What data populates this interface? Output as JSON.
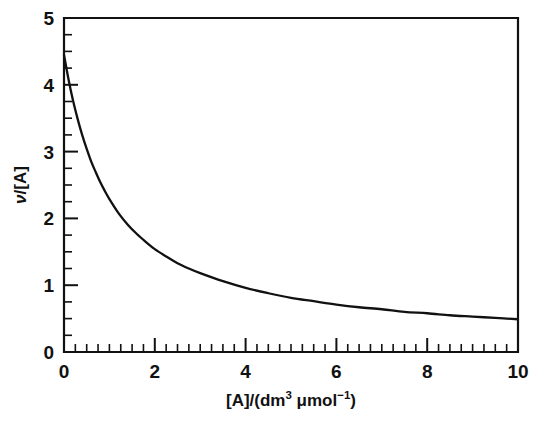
{
  "figure": {
    "background_color": "#ffffff",
    "line_color": "#111111",
    "width": 544,
    "height": 428
  },
  "axes": {
    "x": {
      "title_parts": {
        "lead": "[A]/(dm",
        "exp1": "3",
        "mid": " μmol",
        "exp2": "−1",
        "tail": ")"
      },
      "title_plain": "[A]/(dm3 μmol−1)",
      "tick_labels": [
        "0",
        "2",
        "4",
        "6",
        "8",
        "10"
      ],
      "tick_values": [
        0,
        2,
        4,
        6,
        8,
        10
      ],
      "minor_step": 0.25,
      "range": [
        0,
        10
      ]
    },
    "y": {
      "title_parts": {
        "symbol": "ν",
        "rest": "/[A]"
      },
      "title_plain": "ν/[A]",
      "tick_labels": [
        "0",
        "1",
        "2",
        "3",
        "4",
        "5"
      ],
      "tick_values": [
        0,
        1,
        2,
        3,
        4,
        5
      ],
      "minor_step": 0.25,
      "range": [
        0,
        5
      ]
    }
  },
  "chart_data": {
    "type": "line",
    "title": "",
    "subtitle": "",
    "xlabel": "[A]/(dm3 μmol−1)",
    "ylabel": "ν/[A]",
    "xlim": [
      0,
      10
    ],
    "ylim": [
      0,
      5
    ],
    "grid": false,
    "legend": null,
    "annotations": [],
    "series": [
      {
        "name": "v/[A] vs [A]",
        "color": "#111111",
        "x": [
          0.0,
          0.1,
          0.2,
          0.3,
          0.4,
          0.5,
          0.6,
          0.7,
          0.8,
          0.9,
          1.0,
          1.2,
          1.4,
          1.6,
          1.8,
          2.0,
          2.25,
          2.5,
          2.75,
          3.0,
          3.5,
          4.0,
          4.5,
          5.0,
          5.5,
          6.0,
          6.5,
          7.0,
          7.5,
          8.0,
          8.5,
          9.0,
          9.5,
          10.0
        ],
        "values": [
          4.45,
          4.08,
          3.76,
          3.49,
          3.25,
          3.04,
          2.85,
          2.69,
          2.54,
          2.41,
          2.29,
          2.08,
          1.91,
          1.77,
          1.65,
          1.54,
          1.43,
          1.33,
          1.25,
          1.18,
          1.06,
          0.96,
          0.88,
          0.81,
          0.76,
          0.71,
          0.67,
          0.64,
          0.6,
          0.58,
          0.55,
          0.53,
          0.51,
          0.49
        ]
      }
    ]
  }
}
